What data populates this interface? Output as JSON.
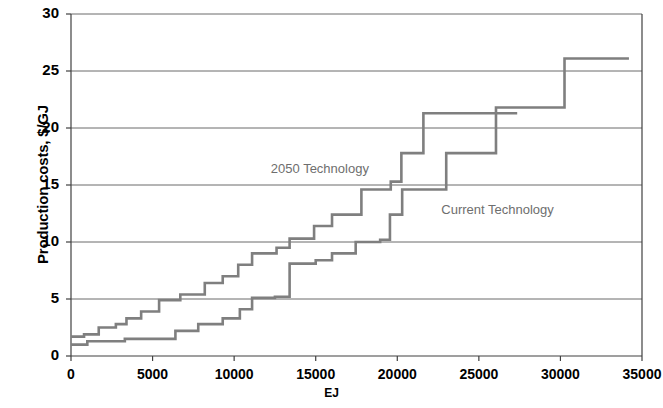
{
  "chart_data": {
    "type": "line",
    "subtype": "step",
    "title": "",
    "xlabel": "EJ",
    "ylabel": "Production costs, $/GJ",
    "xlim": [
      0,
      35000
    ],
    "ylim": [
      0,
      30
    ],
    "xticks": [
      0,
      5000,
      10000,
      15000,
      20000,
      25000,
      30000,
      35000
    ],
    "yticks": [
      0,
      5,
      10,
      15,
      20,
      25,
      30
    ],
    "grid": "horizontal",
    "legend": "inline-annotations",
    "line_color": "#7f7f7f",
    "axis_color": "#404040",
    "series": [
      {
        "name": "2050 Technology",
        "label_x": 12250,
        "label_y": 16.4,
        "steps": [
          {
            "x": 0,
            "y": 1.7
          },
          {
            "x": 800,
            "y": 1.9
          },
          {
            "x": 1700,
            "y": 2.5
          },
          {
            "x": 2750,
            "y": 2.8
          },
          {
            "x": 3400,
            "y": 3.3
          },
          {
            "x": 4300,
            "y": 3.9
          },
          {
            "x": 5400,
            "y": 4.9
          },
          {
            "x": 6700,
            "y": 5.4
          },
          {
            "x": 8200,
            "y": 6.4
          },
          {
            "x": 9300,
            "y": 7.0
          },
          {
            "x": 10250,
            "y": 8.0
          },
          {
            "x": 11100,
            "y": 9.0
          },
          {
            "x": 12600,
            "y": 9.5
          },
          {
            "x": 13400,
            "y": 10.3
          },
          {
            "x": 14900,
            "y": 11.4
          },
          {
            "x": 16000,
            "y": 12.4
          },
          {
            "x": 17800,
            "y": 14.6
          },
          {
            "x": 19600,
            "y": 15.3
          },
          {
            "x": 20250,
            "y": 17.8
          },
          {
            "x": 21600,
            "y": 21.3
          },
          {
            "x": 27350,
            "y": 21.3
          }
        ]
      },
      {
        "name": "Current Technology",
        "label_x": 22700,
        "label_y": 12.8,
        "steps": [
          {
            "x": 0,
            "y": 1.0
          },
          {
            "x": 1000,
            "y": 1.3
          },
          {
            "x": 3300,
            "y": 1.5
          },
          {
            "x": 6400,
            "y": 2.2
          },
          {
            "x": 7800,
            "y": 2.8
          },
          {
            "x": 9300,
            "y": 3.3
          },
          {
            "x": 10350,
            "y": 4.1
          },
          {
            "x": 11100,
            "y": 5.1
          },
          {
            "x": 12500,
            "y": 5.2
          },
          {
            "x": 13400,
            "y": 8.1
          },
          {
            "x": 15000,
            "y": 8.4
          },
          {
            "x": 16000,
            "y": 9.0
          },
          {
            "x": 17450,
            "y": 10.0
          },
          {
            "x": 18950,
            "y": 10.2
          },
          {
            "x": 19550,
            "y": 12.4
          },
          {
            "x": 20300,
            "y": 14.6
          },
          {
            "x": 22950,
            "y": 14.6
          },
          {
            "x": 23000,
            "y": 17.8
          },
          {
            "x": 26000,
            "y": 17.8
          },
          {
            "x": 26050,
            "y": 21.8
          },
          {
            "x": 30200,
            "y": 21.8
          },
          {
            "x": 30250,
            "y": 26.1
          },
          {
            "x": 34200,
            "y": 26.1
          }
        ]
      }
    ]
  },
  "axis": {
    "y_title": "Production costs, $/GJ",
    "x_title": "EJ",
    "y_tick_labels": [
      "30",
      "25",
      "20",
      "15",
      "10",
      "5",
      "0"
    ],
    "x_tick_labels": [
      "0",
      "5000",
      "10000",
      "15000",
      "20000",
      "25000",
      "30000",
      "35000"
    ]
  },
  "annotations": {
    "series_a_label": "2050 Technology",
    "series_b_label": "Current Technology"
  }
}
